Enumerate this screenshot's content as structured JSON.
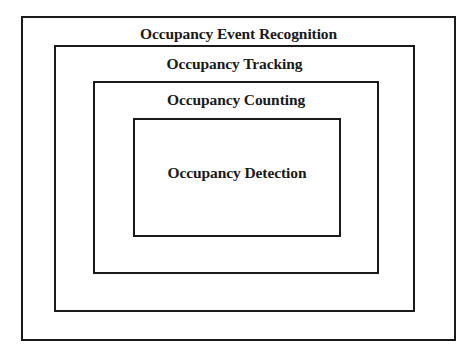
{
  "diagram": {
    "type": "nested-boxes",
    "layers": [
      {
        "label": "Occupancy Event Recognition",
        "level": 1
      },
      {
        "label": "Occupancy Tracking",
        "level": 2
      },
      {
        "label": "Occupancy Counting",
        "level": 3
      },
      {
        "label": "Occupancy Detection",
        "level": 4
      }
    ],
    "colors": {
      "border": "#1a1a1a",
      "text": "#1a1a1a",
      "background": "#ffffff"
    }
  }
}
